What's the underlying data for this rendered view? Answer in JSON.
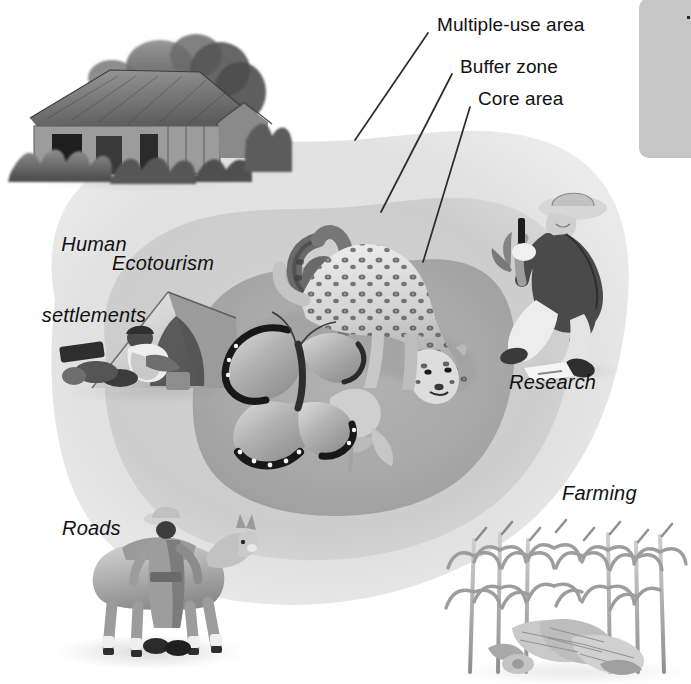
{
  "figure": {
    "style": "grayscale illustration",
    "background_color": "#ffffff"
  },
  "zones": [
    {
      "id": "multiple-use-area",
      "label": "Multiple-use area",
      "order": 1,
      "role": "outermost zone",
      "fill": "#e3e3e3"
    },
    {
      "id": "buffer-zone",
      "label": "Buffer zone",
      "order": 2,
      "role": "middle zone",
      "fill": "#cfcfcf"
    },
    {
      "id": "core-area",
      "label": "Core area",
      "order": 3,
      "role": "innermost protected zone",
      "fill": "#ababab"
    }
  ],
  "callouts": [
    {
      "id": "callout-multiple-use-area",
      "text": "Multiple-use area",
      "text_x": 437,
      "text_y": 16,
      "leader": {
        "x1": 428,
        "y1": 33,
        "x2": 355,
        "y2": 140
      }
    },
    {
      "id": "callout-buffer-zone",
      "text": "Buffer zone",
      "text_x": 460,
      "text_y": 58,
      "leader": {
        "x1": 452,
        "y1": 74,
        "x2": 381,
        "y2": 212
      }
    },
    {
      "id": "callout-core-area",
      "text": "Core area",
      "text_x": 478,
      "text_y": 90,
      "leader": {
        "x1": 470,
        "y1": 107,
        "x2": 423,
        "y2": 262
      }
    }
  ],
  "vignette_labels": [
    {
      "id": "label-human-settlements",
      "line1": "Human",
      "line2": "settlements",
      "x": 18,
      "y": 188,
      "align": "center",
      "width": 150
    },
    {
      "id": "label-ecotourism",
      "line1": "Ecotourism",
      "line2": "",
      "x": 112,
      "y": 252,
      "align": "left",
      "width": 160
    },
    {
      "id": "label-research",
      "line1": "Research",
      "line2": "",
      "x": 509,
      "y": 371,
      "align": "left",
      "width": 140
    },
    {
      "id": "label-farming",
      "line1": "Farming",
      "line2": "",
      "x": 562,
      "y": 482,
      "align": "left",
      "width": 130
    },
    {
      "id": "label-roads",
      "line1": "Roads",
      "line2": "",
      "x": 62,
      "y": 517,
      "align": "left",
      "width": 110
    }
  ],
  "illustrations": [
    {
      "id": "house-illustration",
      "name": "thatched-roof house with vegetation",
      "x": 8,
      "y": 45,
      "w": 250,
      "h": 140
    },
    {
      "id": "tent-illustration",
      "name": "camping tent with camper",
      "x": 62,
      "y": 288,
      "w": 195,
      "h": 112
    },
    {
      "id": "butterfly-illustration",
      "name": "morpho butterfly on flower",
      "x": 205,
      "y": 325,
      "w": 185,
      "h": 140
    },
    {
      "id": "snake-illustration",
      "name": "coiled snake",
      "x": 268,
      "y": 232,
      "w": 78,
      "h": 130
    },
    {
      "id": "jaguar-illustration",
      "name": "jaguar walking",
      "x": 300,
      "y": 240,
      "w": 175,
      "h": 150
    },
    {
      "id": "researcher-illustration",
      "name": "researcher crouching with notebook",
      "x": 495,
      "y": 192,
      "w": 145,
      "h": 185
    },
    {
      "id": "donkey-illustration",
      "name": "man leading a donkey",
      "x": 75,
      "y": 510,
      "w": 160,
      "h": 160
    },
    {
      "id": "cornfield-illustration",
      "name": "cornfield with harvested ears",
      "x": 455,
      "y": 530,
      "w": 235,
      "h": 150
    }
  ],
  "corner_panel": {
    "id": "corner-panel",
    "name": "page margin panel",
    "x": 639,
    "y": 0,
    "width": 52,
    "height": 158,
    "fill": "#c6c6c6"
  }
}
